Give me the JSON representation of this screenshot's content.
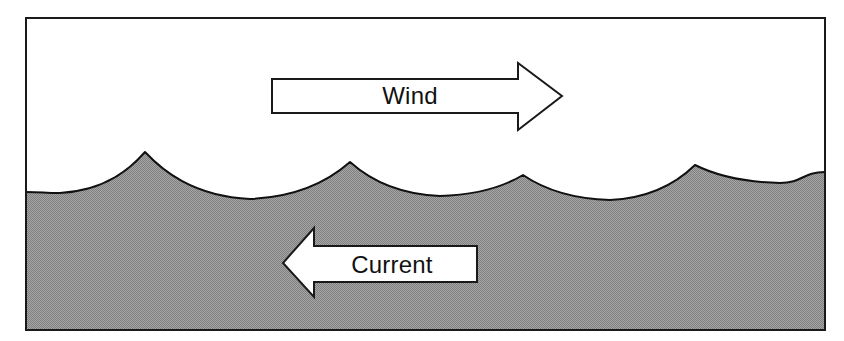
{
  "figure": {
    "name": "wind-against-current-wave-diagram",
    "frame": {
      "x": 25,
      "y": 17,
      "width": 801,
      "height": 314,
      "border_color": "#1a1a1a",
      "border_width": 2,
      "background_color": "#ffffff"
    },
    "water": {
      "label": "water-body",
      "fill_color": "#999999",
      "surface_line_color": "#111111",
      "surface_line_width": 2,
      "mean_surface_y": 186,
      "left_edge_y": 192,
      "right_edge_y": 172
    },
    "waves": {
      "count": 4,
      "description": "Steep short-crested wind waves with sharp peaked crests and broad rounded troughs",
      "crests": [
        {
          "index": 1,
          "x": 145,
          "y": 152
        },
        {
          "index": 2,
          "x": 350,
          "y": 162
        },
        {
          "index": 3,
          "x": 523,
          "y": 175
        },
        {
          "index": 4,
          "x": 695,
          "y": 165
        }
      ],
      "troughs": [
        {
          "index": 1,
          "x": 60,
          "y": 193
        },
        {
          "index": 2,
          "x": 250,
          "y": 199
        },
        {
          "index": 3,
          "x": 440,
          "y": 196
        },
        {
          "index": 4,
          "x": 610,
          "y": 200
        },
        {
          "index": 5,
          "x": 780,
          "y": 183
        }
      ]
    },
    "arrows": [
      {
        "id": "wind-arrow",
        "label": "Wind",
        "direction": "right",
        "fill_color": "#ffffff",
        "outline_color": "#1a1a1a",
        "outline_width": 2,
        "body": {
          "x1": 272,
          "y1": 79,
          "x2": 518,
          "y2": 113
        },
        "head": {
          "notch_x": 518,
          "top_y": 63,
          "bottom_y": 130,
          "tip_x": 562,
          "tip_y": 96
        },
        "label_x": 410,
        "label_y": 104
      },
      {
        "id": "current-arrow",
        "label": "Current",
        "direction": "left",
        "fill_color": "#ffffff",
        "outline_color": "#1a1a1a",
        "outline_width": 2,
        "body": {
          "x1": 314,
          "y1": 246,
          "x2": 477,
          "y2": 282
        },
        "head": {
          "notch_x": 314,
          "top_y": 228,
          "bottom_y": 297,
          "tip_x": 283,
          "tip_y": 263
        },
        "label_x": 392,
        "label_y": 273
      }
    ]
  },
  "chart_data": {
    "type": "diagram",
    "annotations": [
      "Wind",
      "Current"
    ],
    "series": [
      {
        "name": "water-surface-profile",
        "x": [
          25,
          60,
          100,
          125,
          145,
          170,
          205,
          250,
          295,
          330,
          350,
          372,
          405,
          440,
          480,
          505,
          523,
          545,
          578,
          610,
          650,
          678,
          695,
          715,
          748,
          780,
          810,
          826
        ],
        "y": [
          192,
          193,
          190,
          175,
          152,
          176,
          191,
          199,
          194,
          175,
          162,
          177,
          191,
          196,
          192,
          182,
          175,
          184,
          196,
          200,
          193,
          176,
          165,
          177,
          180,
          183,
          176,
          172
        ]
      }
    ],
    "xlabel": "",
    "ylabel": "",
    "legend": [
      "Wind",
      "Current"
    ],
    "grid": false
  }
}
